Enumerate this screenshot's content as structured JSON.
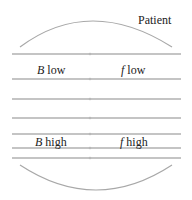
{
  "diagram": {
    "patient_label": "Patient",
    "bands": [
      {
        "var": "B",
        "text": " low",
        "var2": "f",
        "text2": " low"
      },
      {
        "var": "B",
        "text": " high",
        "var2": "f",
        "text2": " high"
      }
    ],
    "line_color": "#b0b0b0",
    "arc_color": "#a8a8a8"
  }
}
